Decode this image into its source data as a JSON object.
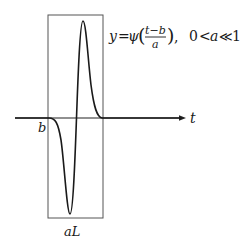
{
  "diagram": {
    "type": "wavelet-illustration",
    "formula": {
      "lhs": "y",
      "equals": "=",
      "func": "ψ",
      "numerator": "t−b",
      "denominator": "a",
      "separator": ",",
      "condition_left": "0",
      "condition_lt": "<",
      "condition_var": "a",
      "condition_ll": "≪",
      "condition_right": "1"
    },
    "axis": {
      "label": "t"
    },
    "labels": {
      "shift": "b",
      "width": "aL"
    },
    "colors": {
      "curve": "#1a1a1a",
      "box": "#555555",
      "axis": "#222222"
    }
  }
}
